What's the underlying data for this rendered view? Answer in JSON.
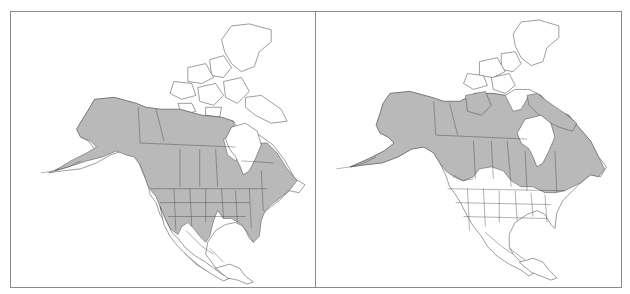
{
  "figure": {
    "colors": {
      "range_fill": "#b9b9b9",
      "outline": "#3a3a3a",
      "frame": "#8a8a8a",
      "background": "#ffffff"
    },
    "panels": [
      {
        "id": "left",
        "label": "",
        "shaded_region": "Alaska, most of Canada south of the Arctic archipelago (excluding Hudson Bay), contiguous United States west of the Rockies/plains and the eastern states, northern Mexico highlands"
      },
      {
        "id": "right",
        "label": "",
        "shaded_region": "Alaska, northern and central Canada including southern Arctic islands and Baffin Island, excluding southern prairie region and contiguous United States"
      }
    ]
  }
}
